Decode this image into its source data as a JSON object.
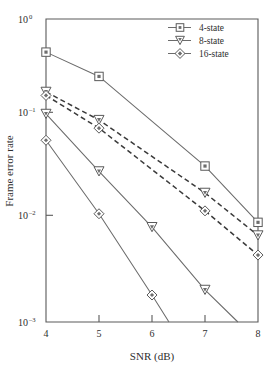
{
  "chart_data": {
    "type": "line",
    "title": "",
    "xlabel": "SNR (dB)",
    "ylabel": "Frame error rate",
    "xlim": [
      4,
      8
    ],
    "ylim": [
      0.001,
      1
    ],
    "yscale": "log",
    "xscale": "linear",
    "xticks": [
      4,
      5,
      6,
      7,
      8
    ],
    "xticklabels": [
      "4",
      "5",
      "6",
      "7",
      "8"
    ],
    "yticks": [
      1,
      0.1,
      0.01,
      0.001
    ],
    "yticklabels": [
      "10^0",
      "10^-1",
      "10^-2",
      "10^-3"
    ],
    "grid": false,
    "legend_position": "upper right",
    "series": [
      {
        "name": "4-state",
        "marker": "square",
        "linestyle": "solid",
        "x": [
          4,
          5,
          7,
          8
        ],
        "y": [
          0.47,
          0.27,
          0.035,
          0.0097
        ]
      },
      {
        "name": "8-state",
        "marker": "triangle-down",
        "linestyle": "solid",
        "x": [
          4,
          5,
          6,
          7,
          7.62
        ],
        "y": [
          0.115,
          0.031,
          0.0087,
          0.00208,
          0.001
        ]
      },
      {
        "name": "16-state",
        "marker": "diamond",
        "linestyle": "solid",
        "x": [
          4,
          5,
          6,
          6.32
        ],
        "y": [
          0.063,
          0.0118,
          0.00185,
          0.001
        ]
      },
      {
        "name": "8-state",
        "marker": "triangle-down",
        "linestyle": "dashed",
        "x": [
          4,
          5,
          7,
          8
        ],
        "y": [
          0.19,
          0.1,
          0.019,
          0.0072
        ]
      },
      {
        "name": "16-state",
        "marker": "diamond",
        "linestyle": "dashed",
        "x": [
          4,
          5,
          7,
          8
        ],
        "y": [
          0.175,
          0.083,
          0.0126,
          0.0046
        ]
      }
    ]
  },
  "axes": {
    "ylabel": "Frame error rate",
    "xlabel": "SNR (dB)",
    "xtick_labels": [
      "4",
      "5",
      "6",
      "7",
      "8"
    ],
    "ytick_labels": [
      {
        "base": "10",
        "exp": "0"
      },
      {
        "base": "10",
        "exp": "–1"
      },
      {
        "base": "10",
        "exp": "–2"
      },
      {
        "base": "10",
        "exp": "–3"
      }
    ]
  },
  "legend": {
    "entries": [
      {
        "label": "4-state",
        "marker": "square"
      },
      {
        "label": "8-state",
        "marker": "triangle-down"
      },
      {
        "label": "16-state",
        "marker": "diamond"
      }
    ]
  },
  "colors": {
    "line": "#6b6b6b",
    "dashed_line": "#3a3a3a",
    "axis": "#5a5a5a",
    "text": "#2e2e2e",
    "background": "#ffffff"
  }
}
